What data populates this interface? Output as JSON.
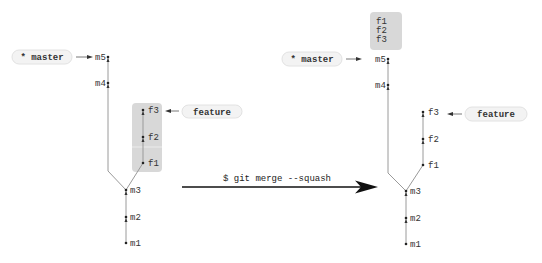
{
  "colors": {
    "edge": "#9a9a9a",
    "commit": "#222222",
    "highlight_box": "#d8d8d8",
    "pill_bg": "#f3f3f3",
    "command_arrow": "#111111"
  },
  "before": {
    "master_ref": "* master",
    "feature_ref": "feature",
    "master_commits": [
      "m1",
      "m2",
      "m3",
      "m4",
      "m5"
    ],
    "feature_commits": [
      "f1",
      "f2",
      "f3"
    ]
  },
  "command": {
    "text": "$ git merge --squash"
  },
  "after": {
    "master_ref": "* master",
    "feature_ref": "feature",
    "master_commits": [
      "m1",
      "m2",
      "m3",
      "m4",
      "m5"
    ],
    "feature_commits": [
      "f1",
      "f2",
      "f3"
    ],
    "squashed_changes": [
      "f1",
      "f2",
      "f3"
    ]
  }
}
